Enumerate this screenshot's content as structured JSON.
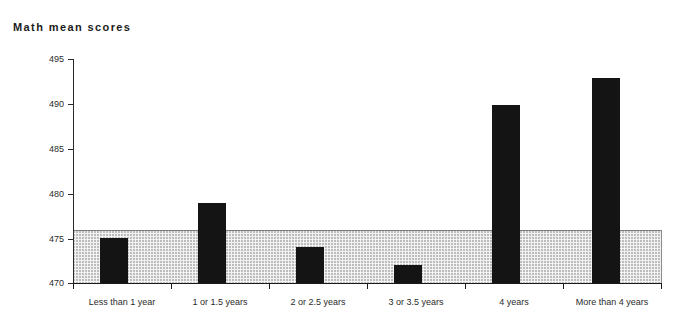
{
  "chart_data": {
    "type": "bar",
    "title": "Math mean scores",
    "xlabel": "",
    "ylabel": "",
    "categories": [
      "Less than 1 year",
      "1 or 1.5 years",
      "2 or 2.5 years",
      "3 or 3.5 years",
      "4 years",
      "More than 4 years"
    ],
    "values": [
      475,
      479,
      474,
      472,
      490,
      493
    ],
    "ylim": [
      470,
      495
    ],
    "ytick_labels": [
      "495",
      "490",
      "485",
      "480",
      "475",
      "470"
    ],
    "ytick_values": [
      495,
      490,
      485,
      480,
      475,
      470
    ],
    "grid": false,
    "legend": null,
    "annotations": [
      {
        "type": "reference-band",
        "label": "shaded band",
        "from": 470,
        "to": 476,
        "color": "#f2f2f2"
      }
    ],
    "bar_color": "#141414"
  },
  "colors": {
    "bar": "#141414",
    "band_fill": "#f2f2f2",
    "band_dots": "#b9b9b9",
    "axis": "#1a1a1a",
    "text": "#2b2b2b"
  }
}
